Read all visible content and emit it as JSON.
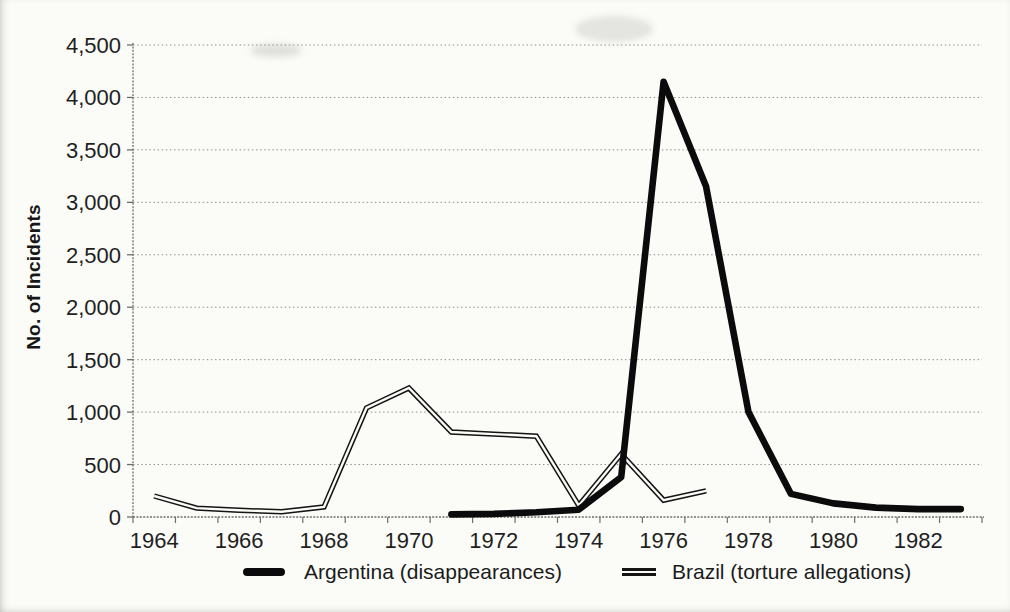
{
  "chart_data": {
    "type": "line",
    "title": "",
    "xlabel": "",
    "ylabel": "No. of Incidents",
    "ylim": [
      0,
      4500
    ],
    "ytick_step": 500,
    "ytick_labels": [
      "0",
      "500",
      "1,000",
      "1,500",
      "2,000",
      "2,500",
      "3,000",
      "3,500",
      "4,000",
      "4,500"
    ],
    "x_categories": [
      1964,
      1965,
      1966,
      1967,
      1968,
      1969,
      1970,
      1971,
      1972,
      1973,
      1974,
      1975,
      1976,
      1977,
      1978,
      1979,
      1980,
      1981,
      1982,
      1983
    ],
    "xtick_labels": [
      "1964",
      "1966",
      "1968",
      "1970",
      "1972",
      "1974",
      "1976",
      "1978",
      "1980",
      "1982"
    ],
    "grid": "horizontal-dotted",
    "legend_position": "bottom-center",
    "series": [
      {
        "name": "Brazil (torture allegations)",
        "style": "double-line",
        "color": "#141414",
        "x": [
          1964,
          1965,
          1966,
          1967,
          1968,
          1969,
          1970,
          1971,
          1972,
          1973,
          1974,
          1975,
          1976,
          1977
        ],
        "values": [
          200,
          85,
          65,
          50,
          95,
          1040,
          1230,
          810,
          790,
          770,
          110,
          600,
          160,
          250
        ]
      },
      {
        "name": "Argentina (disappearances)",
        "style": "thick-solid",
        "color": "#0b0b0b",
        "x": [
          1971,
          1972,
          1973,
          1974,
          1975,
          1976,
          1977,
          1978,
          1979,
          1980,
          1981,
          1982,
          1983
        ],
        "values": [
          25,
          30,
          45,
          70,
          380,
          4150,
          3150,
          1000,
          220,
          130,
          90,
          75,
          75
        ]
      }
    ]
  }
}
